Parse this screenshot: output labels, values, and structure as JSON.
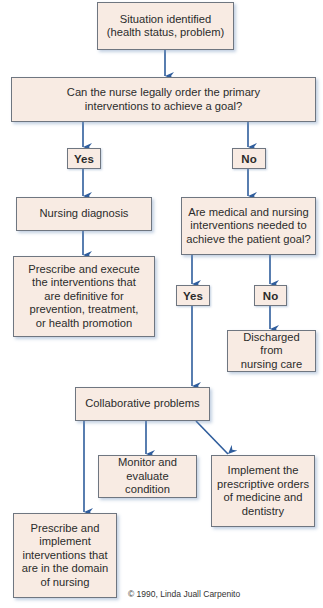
{
  "diagram": {
    "nodes": {
      "situation": "Situation identified\n(health status, problem)",
      "question1": "Can the nurse legally order the primary\ninterventions to achieve a goal?",
      "yes1": "Yes",
      "no1": "No",
      "nursing_diagnosis": "Nursing diagnosis",
      "prescribe_execute": "Prescribe and execute\nthe interventions that\nare definitive for\nprevention, treatment,\nor health promotion",
      "question2": "Are medical and nursing\ninterventions needed to\nachieve the patient goal?",
      "yes2": "Yes",
      "no2": "No",
      "discharged": "Discharged from\nnursing care",
      "collaborative": "Collaborative problems",
      "monitor": "Monitor and\nevaluate condition",
      "implement_orders": "Implement the\nprescriptive orders\nof medicine and\ndentistry",
      "prescribe_implement": "Prescribe and\nimplement\ninterventions that\nare in the domain\nof nursing"
    },
    "copyright": "© 1990, Linda Juall Carpenito",
    "colors": {
      "box_fill": "#f8ebe3",
      "box_border": "#6f7680",
      "arrow": "#2f5d9c"
    }
  }
}
